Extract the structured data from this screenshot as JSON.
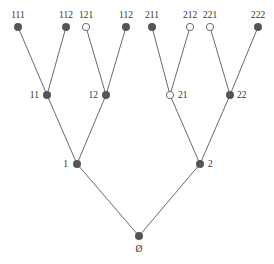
{
  "diagram": {
    "type": "binary-tree",
    "nodes": [
      {
        "id": "root",
        "label": "Ø",
        "filled": true,
        "x": 139,
        "y": 236,
        "lx": 139,
        "ly": 252,
        "anchor": "middle"
      },
      {
        "id": "1",
        "label": "1",
        "filled": true,
        "x": 77,
        "y": 164,
        "lx": 68,
        "ly": 167,
        "anchor": "end"
      },
      {
        "id": "2",
        "label": "2",
        "filled": true,
        "x": 200,
        "y": 164,
        "lx": 208,
        "ly": 167,
        "anchor": "start"
      },
      {
        "id": "11",
        "label": "11",
        "filled": true,
        "x": 47,
        "y": 95,
        "lx": 39,
        "ly": 98,
        "anchor": "end"
      },
      {
        "id": "12",
        "label": "12",
        "filled": true,
        "x": 106,
        "y": 95,
        "lx": 98,
        "ly": 98,
        "anchor": "end"
      },
      {
        "id": "21",
        "label": "21",
        "filled": false,
        "x": 170,
        "y": 95,
        "lx": 178,
        "ly": 98,
        "anchor": "start"
      },
      {
        "id": "22",
        "label": "22",
        "filled": true,
        "x": 230,
        "y": 95,
        "lx": 237,
        "ly": 98,
        "anchor": "start"
      },
      {
        "id": "111",
        "label": "111",
        "filled": true,
        "x": 18,
        "y": 27,
        "lx": 18,
        "ly": 18,
        "anchor": "middle"
      },
      {
        "id": "112a",
        "label": "112",
        "filled": true,
        "x": 66,
        "y": 27,
        "lx": 66,
        "ly": 18,
        "anchor": "middle"
      },
      {
        "id": "121",
        "label": "121",
        "filled": false,
        "x": 86,
        "y": 27,
        "lx": 86,
        "ly": 18,
        "anchor": "middle"
      },
      {
        "id": "112b",
        "label": "112",
        "filled": true,
        "x": 126,
        "y": 27,
        "lx": 126,
        "ly": 18,
        "anchor": "middle"
      },
      {
        "id": "211",
        "label": "211",
        "filled": true,
        "x": 152,
        "y": 27,
        "lx": 152,
        "ly": 18,
        "anchor": "middle"
      },
      {
        "id": "212",
        "label": "212",
        "filled": false,
        "x": 190,
        "y": 27,
        "lx": 190,
        "ly": 18,
        "anchor": "middle"
      },
      {
        "id": "221",
        "label": "221",
        "filled": false,
        "x": 210,
        "y": 27,
        "lx": 210,
        "ly": 18,
        "anchor": "middle"
      },
      {
        "id": "222",
        "label": "222",
        "filled": true,
        "x": 258,
        "y": 27,
        "lx": 258,
        "ly": 18,
        "anchor": "middle"
      }
    ],
    "edges": [
      [
        "root",
        "1"
      ],
      [
        "root",
        "2"
      ],
      [
        "1",
        "11"
      ],
      [
        "1",
        "12"
      ],
      [
        "2",
        "21"
      ],
      [
        "2",
        "22"
      ],
      [
        "11",
        "111"
      ],
      [
        "11",
        "112a"
      ],
      [
        "12",
        "121"
      ],
      [
        "12",
        "112b"
      ],
      [
        "21",
        "211"
      ],
      [
        "21",
        "212"
      ],
      [
        "22",
        "221"
      ],
      [
        "22",
        "222"
      ]
    ]
  }
}
